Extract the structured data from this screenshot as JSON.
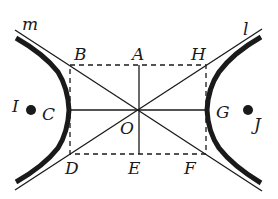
{
  "diagram": {
    "type": "hyperbola-with-asymptotes",
    "colors": {
      "stroke": "#1a1a1a",
      "background": "#ffffff"
    },
    "labels": {
      "m": "m",
      "l": "l",
      "A": "A",
      "B": "B",
      "C": "C",
      "D": "D",
      "E": "E",
      "F": "F",
      "G": "G",
      "H": "H",
      "I": "I",
      "J": "J",
      "O": "O"
    },
    "points": {
      "O": [
        139,
        110
      ],
      "A": [
        139,
        65
      ],
      "B": [
        70,
        65
      ],
      "H": [
        206,
        65
      ],
      "C": [
        69,
        110
      ],
      "G": [
        207,
        110
      ],
      "D": [
        70,
        154
      ],
      "E": [
        139,
        154
      ],
      "F": [
        206,
        154
      ],
      "I": [
        34,
        110
      ],
      "J": [
        248,
        110
      ]
    },
    "elements": [
      "left hyperbola branch (thick)",
      "right hyperbola branch (thick)",
      "asymptote m through B, O, F",
      "asymptote l through D, O, H",
      "dashed rectangle BHFD",
      "segment AE (vertical axis)",
      "segment CG (horizontal axis)",
      "foci I and J (filled dots)"
    ]
  }
}
